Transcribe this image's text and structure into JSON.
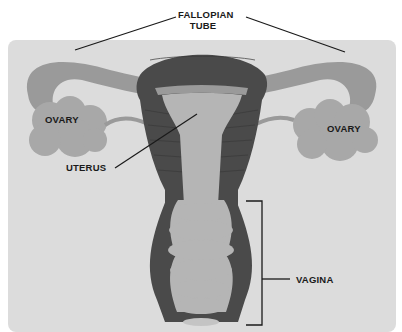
{
  "diagram": {
    "type": "anatomy-illustration",
    "labels": {
      "fallopian_tube_line1": "FALLOPIAN",
      "fallopian_tube_line2": "TUBE",
      "ovary_left": "OVARY",
      "ovary_right": "OVARY",
      "uterus": "UTERUS",
      "vagina": "VAGINA"
    },
    "colors": {
      "background_patch": "#dcdcdc",
      "muscle_dark": "#4a4a4a",
      "tissue_mid": "#9a9a9a",
      "tissue_light": "#b5b5b5",
      "ovary": "#a8a8a8",
      "label_text": "#1a1a1a"
    }
  }
}
